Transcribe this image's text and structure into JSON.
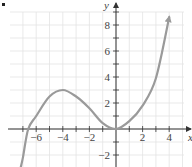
{
  "chart_data": {
    "type": "line",
    "title": "",
    "xlabel": "x",
    "ylabel": "y",
    "xlim": [
      -8,
      5
    ],
    "ylim": [
      -3,
      9
    ],
    "grid": true,
    "x_ticks": [
      -6,
      -4,
      -2,
      2,
      4
    ],
    "y_ticks": [
      -2,
      2,
      4,
      6,
      8
    ],
    "x_tick_labels": [
      "−6",
      "−4",
      "−2",
      "2",
      "4"
    ],
    "y_tick_labels": [
      "−2",
      "2",
      "4",
      "6",
      "8"
    ],
    "series": [
      {
        "name": "f(x)",
        "color": "#9a9a9a",
        "arrows": "both ends",
        "x": [
          -7.2,
          -7.0,
          -6.6,
          -6.0,
          -5.0,
          -4.0,
          -3.0,
          -2.0,
          -1.0,
          0.0,
          1.0,
          2.0,
          3.0,
          4.0
        ],
        "y": [
          -3.1,
          -2.2,
          0.0,
          1.0,
          2.5,
          3.0,
          2.5,
          1.6,
          0.45,
          0.0,
          0.6,
          1.8,
          3.9,
          8.6
        ]
      }
    ],
    "annotations": {
      "local_max": [
        -4,
        3
      ],
      "local_min": [
        0,
        0
      ]
    }
  },
  "colors": {
    "axis": "#333333",
    "grid": "#e3e3e3",
    "curve": "#9a9a9a"
  }
}
